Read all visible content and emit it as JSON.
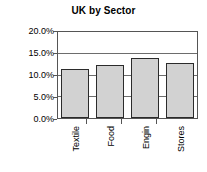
{
  "chart_data": {
    "type": "bar",
    "title": "UK by Sector",
    "xlabel": "",
    "ylabel": "",
    "categories": [
      "Textile",
      "Food",
      "Engin",
      "Stores"
    ],
    "values": [
      11.4,
      12.3,
      13.9,
      12.7
    ],
    "value_labels": [
      "11.4%",
      "12.3%",
      "13.9%",
      "12.7%"
    ],
    "ylim": [
      0,
      20
    ],
    "ytick_values": [
      0,
      5,
      10,
      15,
      20
    ],
    "ytick_labels": [
      "0.0%",
      "5.0%",
      "10.0%",
      "15.0%",
      "20.0%"
    ],
    "grid": true,
    "legend": false,
    "legend_position": "none",
    "colors": {
      "bar_fill": "#d2d2d2",
      "bar_border": "#2b2b2b",
      "gridline": "#6d6d6d",
      "axis": "#555555",
      "text": "#000000",
      "background": "#ffffff"
    }
  }
}
